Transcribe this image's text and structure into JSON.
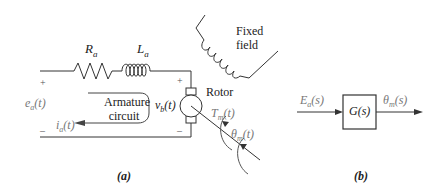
{
  "figure_a": {
    "caption": "(a)",
    "resistor_label": "R",
    "resistor_sub": "a",
    "inductor_label": "L",
    "inductor_sub": "a",
    "field_label_line1": "Fixed",
    "field_label_line2": "field",
    "rotor_label": "Rotor",
    "armature_label_line1": "Armature",
    "armature_label_line2": "circuit",
    "input_voltage": "e",
    "input_voltage_sub": "a",
    "input_voltage_arg": "(t)",
    "current": "i",
    "current_sub": "a",
    "current_arg": "(t)",
    "back_emf": "v",
    "back_emf_sub": "b",
    "back_emf_arg": "(t)",
    "torque": "T",
    "torque_sub": "m",
    "torque_arg": "(t)",
    "angle": "θ",
    "angle_sub": "m",
    "angle_arg": "(t)",
    "plus": "+",
    "minus": "–"
  },
  "figure_b": {
    "caption": "(b)",
    "input": "E",
    "input_sub": "a",
    "input_arg": "(s)",
    "block": "G(s)",
    "output": "θ",
    "output_sub": "m",
    "output_arg": "(s)"
  }
}
